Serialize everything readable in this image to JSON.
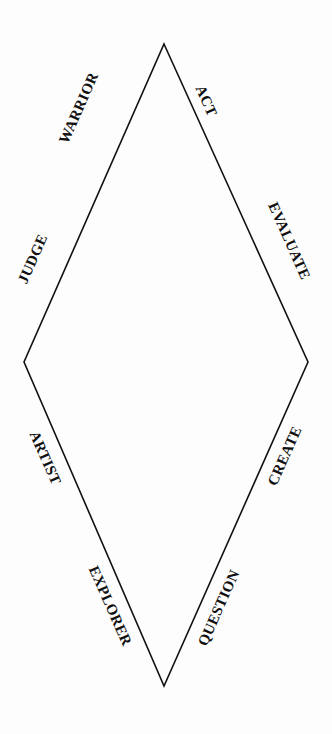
{
  "figure": {
    "type": "diamond-cycle-diagram",
    "shape": "rhombus",
    "background_color": "#fdfdfd",
    "stroke_color": "#111111",
    "text_color": "#101010",
    "vertices": {
      "top": [
        164,
        44
      ],
      "left": [
        24,
        362
      ],
      "right": [
        308,
        362
      ],
      "bottom": [
        164,
        686
      ]
    },
    "edges": [
      {
        "id": "top-left-edge",
        "from": "top",
        "to": "left",
        "labels": [
          "WARRIOR",
          "JUDGE"
        ]
      },
      {
        "id": "top-right-edge",
        "from": "top",
        "to": "right",
        "labels": [
          "ACT",
          "EVALUATE"
        ]
      },
      {
        "id": "left-bottom-edge",
        "from": "left",
        "to": "bottom",
        "labels": [
          "ARTIST",
          "EXPLORER"
        ]
      },
      {
        "id": "right-bottom-edge",
        "from": "right",
        "to": "bottom",
        "labels": [
          "CREATE",
          "QUESTION"
        ]
      }
    ],
    "labels": {
      "warrior": "WARRIOR",
      "act": "ACT",
      "judge": "JUDGE",
      "evaluate": "EVALUATE",
      "artist": "ARTIST",
      "create": "CREATE",
      "explorer": "EXPLORER",
      "question": "QUESTION"
    }
  }
}
